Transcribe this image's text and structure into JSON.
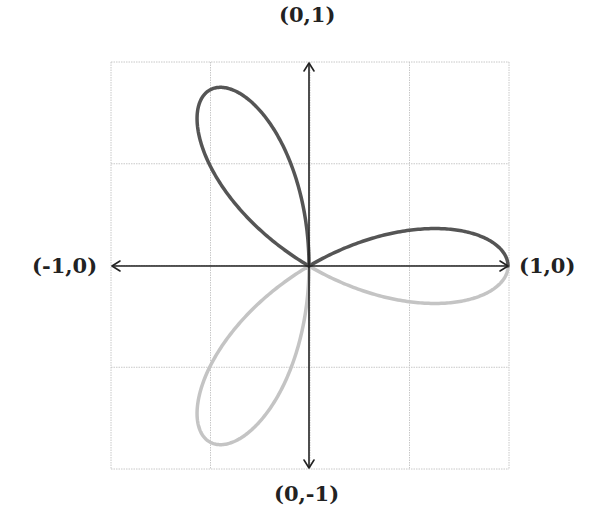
{
  "diagram": {
    "labels": {
      "top": "(0,1)",
      "bottom": "(0,-1)",
      "left": "(-1,0)",
      "right": "(1,0)"
    },
    "grid": {
      "left": 111,
      "top": 62,
      "right": 509,
      "bottom": 469,
      "divisions": 4,
      "color": "#c8c8c8"
    },
    "origin": {
      "x": 309,
      "y": 266
    },
    "scale": {
      "x": 199,
      "y": 203
    },
    "curve": {
      "equation": "r = cos(3θ)",
      "upper_color": "#555555",
      "lower_color": "#c4c4c4",
      "stroke_width": 3.5
    },
    "axis_color": "#222222"
  }
}
